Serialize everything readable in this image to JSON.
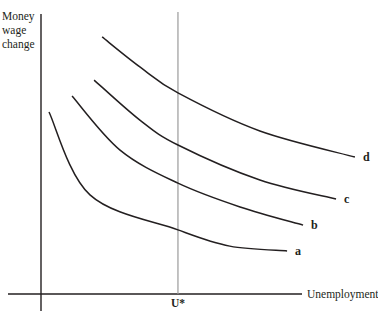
{
  "chart_data": {
    "type": "line",
    "title": "",
    "xlabel": "Unemployment",
    "ylabel_lines": [
      "Money",
      "wage",
      "change"
    ],
    "xlim": [
      0,
      100
    ],
    "ylim": [
      0,
      100
    ],
    "grid": false,
    "legend": "none",
    "reference_lines": [
      {
        "name": "natural-rate",
        "axis": "x",
        "value": 42.8,
        "label": "U*",
        "color": "#9a9a9a"
      }
    ],
    "series": [
      {
        "name": "a",
        "label": "a",
        "color": "#231f20",
        "x": [
          2.5,
          15.3,
          42.8,
          59.0,
          76.9
        ],
        "y": [
          65.0,
          35.4,
          22.9,
          17.1,
          15.4
        ]
      },
      {
        "name": "b",
        "label": "b",
        "color": "#231f20",
        "x": [
          9.7,
          24.7,
          42.8,
          62.2,
          81.9
        ],
        "y": [
          70.7,
          51.4,
          39.6,
          31.1,
          24.6
        ]
      },
      {
        "name": "c",
        "label": "c",
        "color": "#231f20",
        "x": [
          16.6,
          30.9,
          42.8,
          68.4,
          92.2
        ],
        "y": [
          76.4,
          62.1,
          53.2,
          40.7,
          33.9
        ]
      },
      {
        "name": "d",
        "label": "d",
        "color": "#231f20",
        "x": [
          19.1,
          30.9,
          42.8,
          68.4,
          98.1
        ],
        "y": [
          91.8,
          81.1,
          71.8,
          58.2,
          48.9
        ]
      }
    ]
  }
}
